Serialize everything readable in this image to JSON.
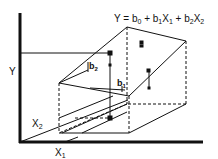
{
  "diagram": {
    "equation": {
      "Y": "Y = b",
      "sub0": "0",
      "p1": " + b",
      "sub1a": "1",
      "x1": "X",
      "sub1b": "1",
      "p2": " + b",
      "sub2a": "2",
      "x2": "X",
      "sub2b": "2"
    },
    "axes": {
      "y_label": "Y",
      "x1_label": "X",
      "x1_sub": "1",
      "x2_label": "X",
      "x2_sub": "2"
    },
    "coefficients": {
      "b1": "b",
      "b1_sub": "1",
      "b2": "b",
      "b2_sub": "2"
    },
    "colors": {
      "line": "#111111",
      "background": "#ffffff"
    }
  }
}
